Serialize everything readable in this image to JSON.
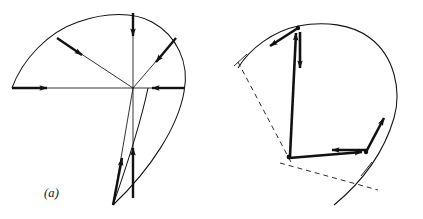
{
  "figure": {
    "stroke_color": "#111111",
    "background_color": "#ffffff"
  },
  "panel_a": {
    "caption": "(a)",
    "description": "Closed teardrop orbit with five inward force arrows pointing toward a common center",
    "center": {
      "x": 133,
      "y": 88
    },
    "arrows": [
      {
        "name": "force-arrow-left",
        "label": "",
        "from": {
          "x": 12,
          "y": 88
        },
        "to": {
          "x": 133,
          "y": 88
        },
        "head_at": {
          "x": 52,
          "y": 88
        }
      },
      {
        "name": "force-arrow-upper-left",
        "label": "",
        "from": {
          "x": 57,
          "y": 38
        },
        "to": {
          "x": 133,
          "y": 88
        },
        "head_at": {
          "x": 86,
          "y": 57
        }
      },
      {
        "name": "force-arrow-top",
        "label": "",
        "from": {
          "x": 133,
          "y": 13
        },
        "to": {
          "x": 133,
          "y": 88
        },
        "head_at": {
          "x": 133,
          "y": 41
        }
      },
      {
        "name": "force-arrow-upper-right",
        "label": "",
        "from": {
          "x": 176,
          "y": 38
        },
        "to": {
          "x": 133,
          "y": 88
        },
        "head_at": {
          "x": 152,
          "y": 66
        }
      },
      {
        "name": "force-arrow-right",
        "label": "",
        "from": {
          "x": 184,
          "y": 88
        },
        "to": {
          "x": 133,
          "y": 88
        },
        "head_at": {
          "x": 148,
          "y": 88
        }
      },
      {
        "name": "force-arrow-lower-left",
        "label": "",
        "from": {
          "x": 113,
          "y": 205
        },
        "to": {
          "x": 133,
          "y": 88
        },
        "head_at": {
          "x": 120,
          "y": 163
        }
      },
      {
        "name": "force-arrow-lower-right",
        "label": "",
        "from": {
          "x": 133,
          "y": 198
        },
        "to": {
          "x": 133,
          "y": 88
        },
        "head_at": {
          "x": 133,
          "y": 153
        }
      }
    ]
  },
  "panel_b": {
    "caption": "(b)",
    "description": "Same orbit with position vectors r_a and r_b from the origin, forces F, velocities v_a and v_b, and perpendicular lever arms r_a-perp and r_b-perp",
    "origin": {
      "x": 75,
      "y": 156
    },
    "points": [
      {
        "name": "point-b",
        "label": "b",
        "x": 87,
        "y": 26
      },
      {
        "name": "point-a",
        "label": "a",
        "x": 157,
        "y": 155
      }
    ],
    "vectors": [
      {
        "name": "position-vector-rb",
        "label": "r",
        "subscript": "b",
        "tail": {
          "x": 78,
          "y": 156
        },
        "head": {
          "x": 84,
          "y": 31
        }
      },
      {
        "name": "position-vector-ra",
        "label": "r",
        "subscript": "a",
        "tail": {
          "x": 78,
          "y": 158
        },
        "head": {
          "x": 152,
          "y": 152
        }
      },
      {
        "name": "force-vector-at-b",
        "label": "F",
        "subscript": "",
        "tail": {
          "x": 87,
          "y": 31
        },
        "head": {
          "x": 87,
          "y": 73
        }
      },
      {
        "name": "force-vector-at-a",
        "label": "F",
        "subscript": "",
        "tail": {
          "x": 155,
          "y": 150
        },
        "head": {
          "x": 118,
          "y": 150
        }
      },
      {
        "name": "velocity-vector-vb",
        "label": "v",
        "subscript": "b",
        "tail": {
          "x": 85,
          "y": 28
        },
        "head": {
          "x": 57,
          "y": 46
        }
      },
      {
        "name": "velocity-vector-va",
        "label": "v",
        "subscript": "a",
        "tail": {
          "x": 155,
          "y": 152
        },
        "head": {
          "x": 172,
          "y": 117
        }
      }
    ],
    "lever_arms": [
      {
        "name": "lever-arm-rb-perp",
        "label": "r",
        "subscript": "b⊥",
        "from": {
          "x": 28,
          "y": 65
        },
        "to": {
          "x": 78,
          "y": 163
        }
      },
      {
        "name": "lever-arm-ra-perp",
        "label": "r",
        "subscript": "a⊥",
        "from": {
          "x": 70,
          "y": 163
        },
        "to": {
          "x": 162,
          "y": 185
        }
      }
    ],
    "labels": {
      "vb": "v",
      "vb_sub": "b",
      "va": "v",
      "va_sub": "a",
      "rb": "r",
      "rb_sub": "b",
      "ra": "r",
      "ra_sub": "a",
      "force_b": "F",
      "force_a": "F",
      "point_b": "b",
      "point_a": "a",
      "rb_perp": "r",
      "rb_perp_sub": "b⊥",
      "ra_perp": "r",
      "ra_perp_sub": "a⊥"
    }
  }
}
